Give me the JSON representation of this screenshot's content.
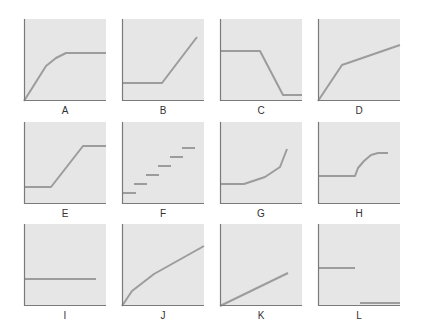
{
  "figure": {
    "panel_size": 82,
    "colors": {
      "background": "#e6e6e6",
      "axis": "#7a7a7a",
      "line": "#9c9c9c"
    },
    "panels": [
      {
        "label": "A",
        "x": 24,
        "y": 19,
        "segments": [
          [
            [
              0,
              0
            ],
            [
              22,
              35
            ],
            [
              32,
              43
            ],
            [
              42,
              48
            ],
            [
              82,
              48
            ]
          ]
        ]
      },
      {
        "label": "B",
        "x": 122,
        "y": 19,
        "segments": [
          [
            [
              0,
              18
            ],
            [
              40,
              18
            ],
            [
              75,
              64
            ]
          ]
        ]
      },
      {
        "label": "C",
        "x": 220,
        "y": 19,
        "segments": [
          [
            [
              0,
              50
            ],
            [
              40,
              50
            ],
            [
              63,
              6
            ],
            [
              82,
              6
            ]
          ]
        ]
      },
      {
        "label": "D",
        "x": 318,
        "y": 19,
        "segments": [
          [
            [
              0,
              0
            ],
            [
              24,
              36
            ],
            [
              82,
              56
            ]
          ]
        ]
      },
      {
        "label": "E",
        "x": 24,
        "y": 122,
        "segments": [
          [
            [
              0,
              17
            ],
            [
              27,
              17
            ],
            [
              59,
              58
            ],
            [
              82,
              58
            ]
          ]
        ]
      },
      {
        "label": "F",
        "x": 122,
        "y": 122,
        "segments": [
          [
            [
              0,
              11
            ],
            [
              14,
              11
            ]
          ],
          [
            [
              12,
              20
            ],
            [
              25,
              20
            ]
          ],
          [
            [
              24,
              29
            ],
            [
              37,
              29
            ]
          ],
          [
            [
              36,
              38
            ],
            [
              49,
              38
            ]
          ],
          [
            [
              48,
              47
            ],
            [
              61,
              47
            ]
          ],
          [
            [
              60,
              56
            ],
            [
              73,
              56
            ]
          ]
        ]
      },
      {
        "label": "G",
        "x": 220,
        "y": 122,
        "segments": [
          [
            [
              0,
              20
            ],
            [
              24,
              20
            ],
            [
              45,
              27
            ],
            [
              60,
              37
            ],
            [
              67,
              55
            ]
          ]
        ]
      },
      {
        "label": "H",
        "x": 318,
        "y": 122,
        "segments": [
          [
            [
              0,
              28
            ],
            [
              37,
              28
            ],
            [
              40,
              36
            ],
            [
              46,
              43
            ],
            [
              53,
              49
            ],
            [
              60,
              51
            ],
            [
              70,
              51
            ]
          ]
        ]
      },
      {
        "label": "I",
        "x": 24,
        "y": 224,
        "segments": [
          [
            [
              0,
              27
            ],
            [
              72,
              27
            ]
          ]
        ]
      },
      {
        "label": "J",
        "x": 122,
        "y": 224,
        "segments": [
          [
            [
              0,
              0
            ],
            [
              10,
              15
            ],
            [
              32,
              32
            ],
            [
              82,
              60
            ]
          ]
        ]
      },
      {
        "label": "K",
        "x": 220,
        "y": 224,
        "segments": [
          [
            [
              0,
              0
            ],
            [
              68,
              33
            ]
          ]
        ]
      },
      {
        "label": "L",
        "x": 318,
        "y": 224,
        "segments": [
          [
            [
              0,
              38
            ],
            [
              37,
              38
            ]
          ],
          [
            [
              42,
              3
            ],
            [
              82,
              3
            ]
          ]
        ]
      }
    ]
  }
}
